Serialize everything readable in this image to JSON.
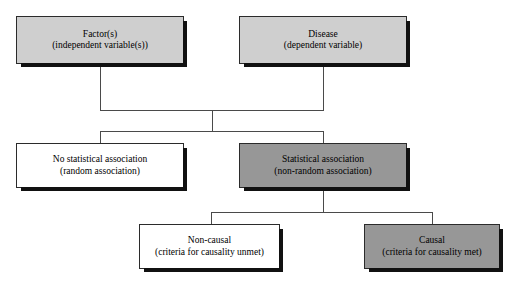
{
  "diagram": {
    "colors": {
      "light_gray": "#cfcfcf",
      "mid_gray": "#979797",
      "white": "#ffffff",
      "line": "#4a4a4a",
      "shadow": "#111111",
      "text": "#000000"
    },
    "nodes": [
      {
        "id": "factors",
        "line1": "Factor(s)",
        "line2": "(independent variable(s))"
      },
      {
        "id": "disease",
        "line1": "Disease",
        "line2": "(dependent variable)"
      },
      {
        "id": "no-statistical-association",
        "line1": "No statistical association",
        "line2": "(random association)"
      },
      {
        "id": "statistical-association",
        "line1": "Statistical association",
        "line2": "(non-random association)"
      },
      {
        "id": "non-causal",
        "line1": "Non-causal",
        "line2": "(criteria for causality unmet)"
      },
      {
        "id": "causal",
        "line1": "Causal",
        "line2": "(criteria for causality met)"
      }
    ]
  }
}
